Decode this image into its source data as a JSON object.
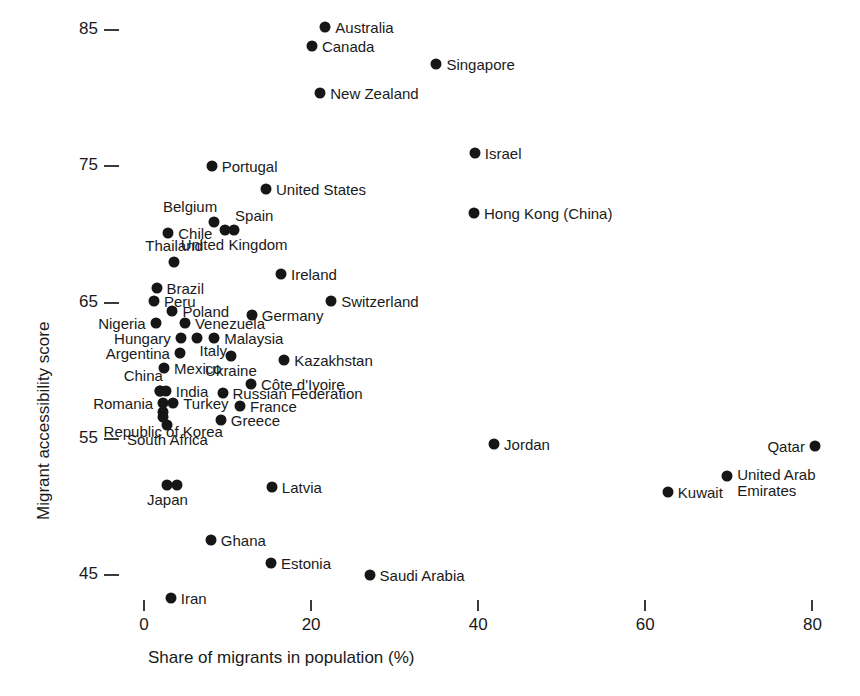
{
  "chart_data": {
    "type": "scatter",
    "title": "",
    "xlabel": "Share of migrants in population (%)",
    "ylabel": "Migrant accessibility score",
    "xlim": [
      -2,
      84
    ],
    "ylim": [
      42.5,
      87
    ],
    "grid": false,
    "legend": "none",
    "xticks": [
      0,
      20,
      40,
      60,
      80
    ],
    "xtick_labels": [
      "0",
      "20",
      "40",
      "60",
      "80"
    ],
    "yticks": [
      45,
      55,
      65,
      75,
      85
    ],
    "ytick_labels": [
      "45",
      "55",
      "65",
      "75",
      "85"
    ],
    "marker": {
      "shape": "circle",
      "color": "#161616",
      "size_px": 11
    },
    "points": [
      {
        "label": "Australia",
        "x": 21.7,
        "y": 85.2,
        "lab": "right"
      },
      {
        "label": "Canada",
        "x": 20.1,
        "y": 83.8,
        "lab": "right"
      },
      {
        "label": "Singapore",
        "x": 35.0,
        "y": 82.5,
        "lab": "right"
      },
      {
        "label": "New Zealand",
        "x": 21.1,
        "y": 80.4,
        "lab": "right"
      },
      {
        "label": "Israel",
        "x": 39.6,
        "y": 76.0,
        "lab": "right"
      },
      {
        "label": "Portugal",
        "x": 8.1,
        "y": 75.0,
        "lab": "right"
      },
      {
        "label": "United States",
        "x": 14.6,
        "y": 73.3,
        "lab": "right"
      },
      {
        "label": "Hong Kong (China)",
        "x": 39.5,
        "y": 71.6,
        "lab": "right"
      },
      {
        "label": "Belgium",
        "x": 8.4,
        "y": 70.9,
        "lab": "above-left"
      },
      {
        "label": "Spain",
        "x": 9.7,
        "y": 70.3,
        "lab": "above-right"
      },
      {
        "label": "Chile",
        "x": 2.9,
        "y": 70.1,
        "lab": "right"
      },
      {
        "label": "United Kingdom",
        "x": 10.8,
        "y": 70.3,
        "lab": "below"
      },
      {
        "label": "Thailand",
        "x": 3.6,
        "y": 68.0,
        "lab": "above"
      },
      {
        "label": "Ireland",
        "x": 16.4,
        "y": 67.1,
        "lab": "right"
      },
      {
        "label": "Brazil",
        "x": 1.5,
        "y": 66.1,
        "lab": "right"
      },
      {
        "label": "Peru",
        "x": 1.2,
        "y": 65.1,
        "lab": "right"
      },
      {
        "label": "Switzerland",
        "x": 22.4,
        "y": 65.1,
        "lab": "right"
      },
      {
        "label": "Poland",
        "x": 3.4,
        "y": 64.4,
        "lab": "right"
      },
      {
        "label": "Germany",
        "x": 12.9,
        "y": 64.1,
        "lab": "right"
      },
      {
        "label": "Nigeria",
        "x": 1.4,
        "y": 63.5,
        "lab": "left"
      },
      {
        "label": "Venezuela",
        "x": 4.9,
        "y": 63.5,
        "lab": "right"
      },
      {
        "label": "Hungary",
        "x": 4.4,
        "y": 62.4,
        "lab": "left"
      },
      {
        "label": "Malaysia",
        "x": 8.4,
        "y": 62.4,
        "lab": "right"
      },
      {
        "label": "Italy",
        "x": 6.4,
        "y": 62.4,
        "lab": "below-right"
      },
      {
        "label": "Argentina",
        "x": 4.3,
        "y": 61.3,
        "lab": "left"
      },
      {
        "label": "Ukraine",
        "x": 10.4,
        "y": 61.1,
        "lab": "below"
      },
      {
        "label": "Kazakhstan",
        "x": 16.8,
        "y": 60.8,
        "lab": "right"
      },
      {
        "label": "Mexico",
        "x": 2.4,
        "y": 60.2,
        "lab": "right"
      },
      {
        "label": "Côte d'Ivoire",
        "x": 12.8,
        "y": 59.0,
        "lab": "right"
      },
      {
        "label": "China",
        "x": 1.9,
        "y": 58.5,
        "lab": "above-left"
      },
      {
        "label": "India",
        "x": 2.6,
        "y": 58.5,
        "lab": "right"
      },
      {
        "label": "Russian Federation",
        "x": 9.4,
        "y": 58.4,
        "lab": "right"
      },
      {
        "label": "Romania",
        "x": 2.3,
        "y": 57.6,
        "lab": "left"
      },
      {
        "label": "Turkey",
        "x": 3.5,
        "y": 57.6,
        "lab": "right"
      },
      {
        "label": "France",
        "x": 11.5,
        "y": 57.4,
        "lab": "right"
      },
      {
        "label": "Republic of Korea",
        "x": 2.3,
        "y": 56.6,
        "lab": "below"
      },
      {
        "label": "Greece",
        "x": 9.2,
        "y": 56.4,
        "lab": "right"
      },
      {
        "label": "South Africa",
        "x": 2.8,
        "y": 56.0,
        "lab": "below"
      },
      {
        "label": "Jordan",
        "x": 41.9,
        "y": 54.6,
        "lab": "right"
      },
      {
        "label": "Qatar",
        "x": 80.3,
        "y": 54.5,
        "lab": "left"
      },
      {
        "label": "United Arab Emirates",
        "x": 69.8,
        "y": 52.3,
        "lab": "below-right"
      },
      {
        "label": "Japan",
        "x": 2.8,
        "y": 51.6,
        "lab": "below"
      },
      {
        "label": "Latvia",
        "x": 15.3,
        "y": 51.5,
        "lab": "right"
      },
      {
        "label": "Kuwait",
        "x": 62.7,
        "y": 51.1,
        "lab": "right"
      },
      {
        "label": "Ghana",
        "x": 8.0,
        "y": 47.6,
        "lab": "right"
      },
      {
        "label": "Estonia",
        "x": 15.2,
        "y": 45.9,
        "lab": "right"
      },
      {
        "label": "Saudi Arabia",
        "x": 27.0,
        "y": 45.0,
        "lab": "right"
      },
      {
        "label": "Iran",
        "x": 3.2,
        "y": 43.3,
        "lab": "right"
      }
    ],
    "extra_points": [
      {
        "label": "Japan-pair-b",
        "x": 3.9,
        "y": 51.6
      },
      {
        "label": "SouthAfrica-stack",
        "x": 2.3,
        "y": 57.0
      },
      {
        "label": "China-overlap",
        "x": 1.9,
        "y": 58.5
      }
    ]
  },
  "axes": {
    "x_title": "Share of migrants in population (%)",
    "y_title": "Migrant accessibility score"
  }
}
